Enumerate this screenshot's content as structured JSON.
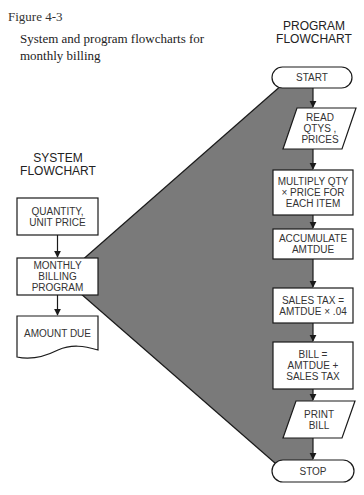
{
  "figure": {
    "label": "Figure 4-3",
    "caption_line1": "System and program flowcharts for",
    "caption_line2": "monthly billing"
  },
  "colors": {
    "shade": "#7a7a7a",
    "stroke": "#1a1a1a",
    "box_fill": "#ffffff",
    "text": "#333333"
  },
  "system_flowchart": {
    "heading_line1": "SYSTEM",
    "heading_line2": "FLOWCHART",
    "nodes": [
      {
        "shape": "rectangle",
        "line1": "QUANTITY,",
        "line2": "UNIT PRICE"
      },
      {
        "shape": "rectangle",
        "line1": "MONTHLY",
        "line2": "BILLING",
        "line3": "PROGRAM"
      },
      {
        "shape": "document",
        "line1": "AMOUNT DUE"
      }
    ]
  },
  "program_flowchart": {
    "heading_line1": "PROGRAM",
    "heading_line2": "FLOWCHART",
    "nodes": [
      {
        "shape": "terminal",
        "line1": "START"
      },
      {
        "shape": "parallelogram",
        "line1": "READ",
        "line2": "QTYS ,",
        "line3": "PRICES"
      },
      {
        "shape": "rectangle",
        "line1": "MULTIPLY QTY",
        "line2": "× PRICE FOR",
        "line3": "EACH ITEM"
      },
      {
        "shape": "rectangle",
        "line1": "ACCUMULATE",
        "line2": "AMTDUE"
      },
      {
        "shape": "rectangle",
        "line1": "SALES TAX =",
        "line2": "AMTDUE × .04"
      },
      {
        "shape": "rectangle",
        "line1": "BILL =",
        "line2": "AMTDUE +",
        "line3": "SALES TAX"
      },
      {
        "shape": "parallelogram",
        "line1": "PRINT",
        "line2": "BILL"
      },
      {
        "shape": "terminal",
        "line1": "STOP"
      }
    ]
  }
}
